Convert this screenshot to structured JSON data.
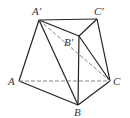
{
  "diagram": {
    "type": "geometry-solid",
    "points": {
      "A": [
        19,
        81
      ],
      "B": [
        78,
        105
      ],
      "C": [
        110,
        81
      ],
      "A1": [
        39,
        20
      ],
      "B1": [
        79,
        36
      ],
      "C1": [
        97,
        19
      ]
    },
    "labels": {
      "A": "A",
      "B": "B",
      "C": "C",
      "A1": "A′",
      "B1": "B′",
      "C1": "C′"
    },
    "solid_edges": [
      [
        "A",
        "B"
      ],
      [
        "B",
        "C"
      ],
      [
        "A",
        "A1"
      ],
      [
        "A1",
        "C1"
      ],
      [
        "C1",
        "C"
      ],
      [
        "A1",
        "B1"
      ],
      [
        "B1",
        "C1"
      ],
      [
        "B1",
        "B"
      ],
      [
        "A1",
        "B"
      ],
      [
        "B1",
        "C"
      ]
    ],
    "dashed_edges": [
      [
        "A",
        "C"
      ],
      [
        "A1",
        "C"
      ]
    ],
    "colors": {
      "line": "#222222",
      "dashed": "#888888",
      "label": "#333333"
    }
  }
}
